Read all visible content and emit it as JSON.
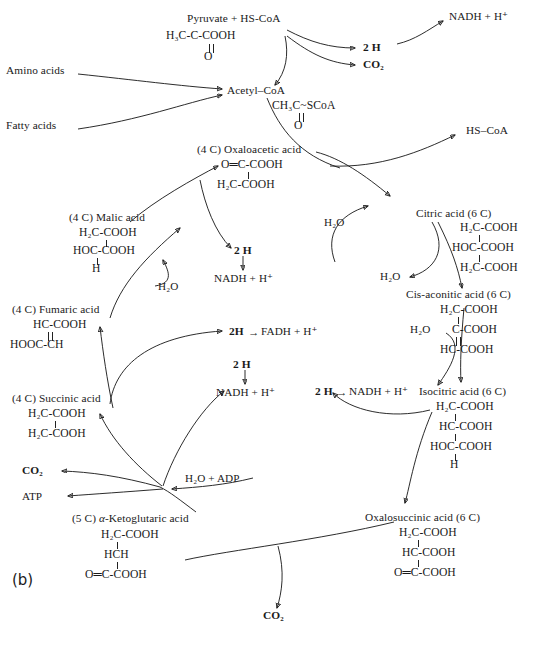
{
  "figure": {
    "panel_label": "(b)"
  },
  "nodes": {
    "pyruvate": {
      "name": "Pyruvate + HS-CoA",
      "formula_top": "H₃C-C-COOH",
      "formula_bottom": "O"
    },
    "acetyl_coa": {
      "name": "Acetyl–CoA",
      "formula_top": "CH₃C~SCoA",
      "formula_bottom": "O"
    },
    "amino_acids": {
      "name": "Amino acids"
    },
    "fatty_acids": {
      "name": "Fatty acids"
    },
    "hs_coa_out": {
      "name": "HS–CoA"
    },
    "oxaloacetic": {
      "name": "(4 C) Oxaloacetic acid",
      "lines": [
        "O═C-COOH",
        "H₂C-COOH"
      ]
    },
    "malic": {
      "name": "(4 C) Malic acid",
      "lines": [
        "H₂C-COOH",
        "HOC-COOH",
        "H"
      ]
    },
    "fumaric": {
      "name": "(4 C) Fumaric acid",
      "lines": [
        "HC-COOH",
        "HOOC-CH"
      ]
    },
    "succinic": {
      "name": "(4 C) Succinic acid",
      "lines": [
        "H₂C-COOH",
        "H₂C-COOH"
      ]
    },
    "ketoglutaric": {
      "name_prefix": "(5 C) ",
      "name_italic": "α",
      "name_suffix": "-Ketoglutaric acid",
      "lines": [
        "H₂C-COOH",
        "HCH",
        "O═C-COOH"
      ]
    },
    "oxalosuccinic": {
      "name": "Oxalosuccinic acid (6 C)",
      "lines": [
        "H₂C-COOH",
        "HC-COOH",
        "O═C-COOH"
      ]
    },
    "isocitric": {
      "name": "Isocitric acid (6 C)",
      "lines": [
        "H₂C-COOH",
        "HC-COOH",
        "HOC-COOH",
        "H"
      ]
    },
    "cis_aconitic": {
      "name": "Cis-aconitic acid (6 C)",
      "lines": [
        "H₂C-COOH",
        "C-COOH",
        "HC-COOH"
      ]
    },
    "citric": {
      "name": "Citric acid (6 C)",
      "lines": [
        "H₂C-COOH",
        "HOC-COOH",
        "H₂C-COOH"
      ]
    }
  },
  "cofactors": {
    "two_h_pyruvate": "2 H",
    "co2_pyruvate": "CO₂",
    "nadh_pyruvate": "NADH + H⁺",
    "two_h_oxaloacetic": "2 H",
    "nadh_oxaloacetic": "NADH + H⁺",
    "two_h_fadh": "2H",
    "fadh": "FADH + H⁺",
    "fadh_arrow": "→",
    "two_h_succinate": "2 H",
    "nadh_succinate": "NADH + H⁺",
    "two_h_isocitrate": "2 H",
    "isocitrate_arrow": "→",
    "nadh_isocitrate": "NADH + H⁺",
    "water_malic": "H₂O",
    "water_citrate_in": "H₂O",
    "water_citrate_out": "H₂O",
    "water_aconitate": "H₂O",
    "water_adp": "H₂O + ADP",
    "atp": "ATP",
    "co2_succinyl": "CO₂",
    "co2_oxalosuccinate": "CO₂"
  },
  "colors": {
    "stroke": "#141414",
    "text": "#1a1a1a",
    "background": "#ffffff"
  }
}
